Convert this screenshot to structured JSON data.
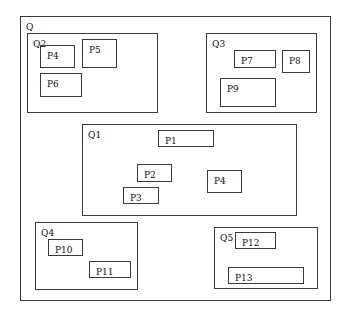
{
  "diagram": {
    "type": "nested-regions",
    "outer": {
      "label": "Q",
      "rect": [
        20,
        16,
        311,
        285
      ]
    },
    "regions": [
      {
        "id": "Q2",
        "label": "Q2",
        "rect": [
          27,
          33,
          131,
          80
        ],
        "pages": [
          {
            "label": "P4",
            "rect": [
              40,
              45,
              35,
              23
            ]
          },
          {
            "label": "P5",
            "rect": [
              82,
              39,
              35,
              29
            ]
          },
          {
            "label": "P6",
            "rect": [
              40,
              73,
              42,
              24
            ]
          }
        ]
      },
      {
        "id": "Q3",
        "label": "Q3",
        "rect": [
          206,
          33,
          111,
          80
        ],
        "pages": [
          {
            "label": "P7",
            "rect": [
              234,
              50,
              42,
              18
            ]
          },
          {
            "label": "P8",
            "rect": [
              282,
              50,
              28,
              23
            ]
          },
          {
            "label": "P9",
            "rect": [
              220,
              78,
              56,
              29
            ]
          }
        ]
      },
      {
        "id": "Q1",
        "label": "Q1",
        "rect": [
          82,
          124,
          215,
          92
        ],
        "pages": [
          {
            "label": "P1",
            "rect": [
              158,
              130,
              56,
              17
            ]
          },
          {
            "label": "P2",
            "rect": [
              137,
              164,
              35,
              18
            ]
          },
          {
            "label": "P4",
            "rect": [
              207,
              170,
              35,
              23
            ]
          },
          {
            "label": "P3",
            "rect": [
              123,
              187,
              36,
              17
            ]
          }
        ]
      },
      {
        "id": "Q4",
        "label": "Q4",
        "rect": [
          35,
          222,
          103,
          68
        ],
        "pages": [
          {
            "label": "P10",
            "rect": [
              48,
              239,
              35,
              17
            ]
          },
          {
            "label": "P11",
            "rect": [
              89,
              261,
              42,
              17
            ]
          }
        ]
      },
      {
        "id": "Q5",
        "label": "Q5",
        "rect": [
          214,
          227,
          104,
          62
        ],
        "pages": [
          {
            "label": "P12",
            "rect": [
              235,
              232,
              41,
              17
            ]
          },
          {
            "label": "P13",
            "rect": [
              228,
              267,
              76,
              17
            ]
          }
        ]
      }
    ]
  }
}
